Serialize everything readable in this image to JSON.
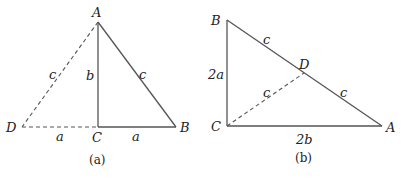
{
  "figure_a": {
    "caption": "(a)",
    "vertices": {
      "A": "A",
      "B": "B",
      "C": "C",
      "D": "D"
    },
    "edge_labels": {
      "AC": "b",
      "AB": "c",
      "AD": "c",
      "DC": "a",
      "CB": "a"
    }
  },
  "figure_b": {
    "caption": "(b)",
    "vertices": {
      "A": "A",
      "B": "B",
      "C": "C",
      "D": "D"
    },
    "edge_labels": {
      "BC": "2a",
      "CA": "2b",
      "BD": "c",
      "DA": "c",
      "CD": "c"
    }
  }
}
